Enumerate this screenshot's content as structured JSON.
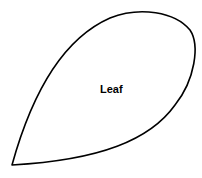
{
  "diagram": {
    "shape": "leaf-outline",
    "label": "Leaf",
    "stroke_color": "#000000",
    "fill_color": "#ffffff"
  }
}
